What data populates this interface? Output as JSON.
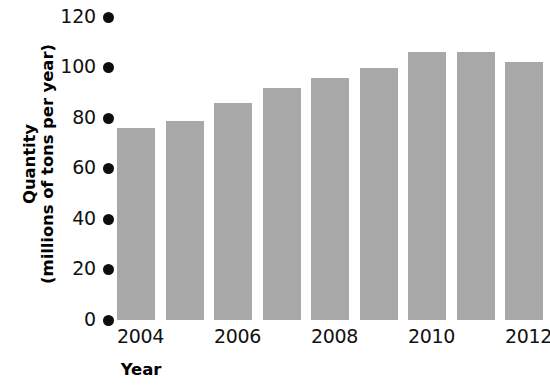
{
  "chart_data": {
    "type": "bar",
    "title": "",
    "xlabel": "Year",
    "ylabel": "Quantity (millions of tons per year)",
    "ylabel_lines": [
      "Quantity",
      "(millions of tons per year)"
    ],
    "categories": [
      "2004",
      "2005",
      "2006",
      "2007",
      "2008",
      "2009",
      "2010",
      "2011",
      "2012"
    ],
    "values": [
      76,
      79,
      86,
      92,
      96,
      100,
      106,
      106,
      102
    ],
    "x_tick_labels": [
      "2004",
      "",
      "2006",
      "",
      "2008",
      "",
      "2010",
      "",
      "2012"
    ],
    "y_ticks": [
      0,
      20,
      40,
      60,
      80,
      100,
      120
    ],
    "ylim": [
      0,
      120
    ],
    "grid": false,
    "legend": false,
    "legend_position": "none",
    "bar_color": "#a8a8a8",
    "text_color": "#111111",
    "tick_marker_color": "#0d0d0d",
    "background_color": "#ffffff"
  }
}
